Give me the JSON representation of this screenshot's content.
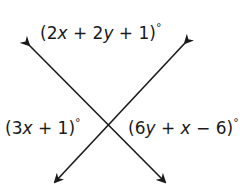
{
  "diagram": {
    "type": "intersecting-lines-angles",
    "labels": {
      "top": "(2x + 2y + 1)°",
      "left": "(3x + 1)°",
      "right": "(6y + x − 6)°"
    },
    "label_parts": {
      "top": {
        "open": "(2",
        "v1": "x",
        "mid": " + 2",
        "v2": "y",
        "close": " + 1)",
        "deg": "°"
      },
      "left": {
        "open": "(3",
        "v1": "x",
        "close": " + 1)",
        "deg": "°"
      },
      "right": {
        "open": "(6",
        "v1": "y",
        "mid": " + ",
        "v2": "x",
        "close": " − 6)",
        "deg": "°"
      }
    },
    "lines": [
      {
        "from": [
          29,
          45
        ],
        "to": [
          165,
          182
        ]
      },
      {
        "from": [
          185,
          43
        ],
        "to": [
          55,
          182
        ]
      }
    ],
    "stroke_color": "#1a1a1a"
  }
}
